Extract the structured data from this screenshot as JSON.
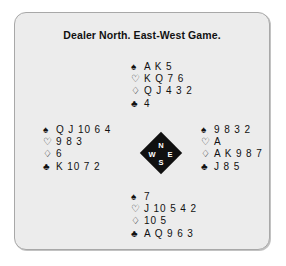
{
  "deal": {
    "title": "Dealer North. East-West Game.",
    "suit_symbols": {
      "spade": "♠",
      "heart": "♡",
      "diamond": "♢",
      "club": "♣"
    },
    "compass": {
      "north": "N",
      "west": "W",
      "east": "E",
      "south": "S"
    },
    "hands": {
      "north": {
        "spades": "A K 5",
        "hearts": "K Q 7 6",
        "diamonds": "Q J 4 3 2",
        "clubs": "4"
      },
      "west": {
        "spades": "Q J 10 6 4",
        "hearts": "9 8 3",
        "diamonds": "6",
        "clubs": "K 10 7 2"
      },
      "east": {
        "spades": "9 8 3 2",
        "hearts": "A",
        "diamonds": "A K 9 8 7",
        "clubs": "J 8 5"
      },
      "south": {
        "spades": "7",
        "hearts": "J 10 5 4 2",
        "diamonds": "10 5",
        "clubs": "A Q 9 6 3"
      }
    }
  }
}
